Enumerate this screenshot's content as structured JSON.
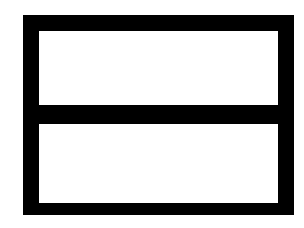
{
  "figure": {
    "colors": {
      "stroke": "#000000",
      "fill": "#ffffff",
      "background": "#ffffff"
    },
    "frame": {
      "x": 23,
      "y": 15,
      "width": 271,
      "height": 200,
      "stroke_width": 16
    },
    "divider": {
      "y": 105,
      "height": 19
    },
    "panes": [
      {
        "name": "top-pane",
        "x": 39,
        "y": 31,
        "width": 239,
        "height": 74
      },
      {
        "name": "bottom-pane",
        "x": 39,
        "y": 124,
        "width": 239,
        "height": 79
      }
    ]
  }
}
